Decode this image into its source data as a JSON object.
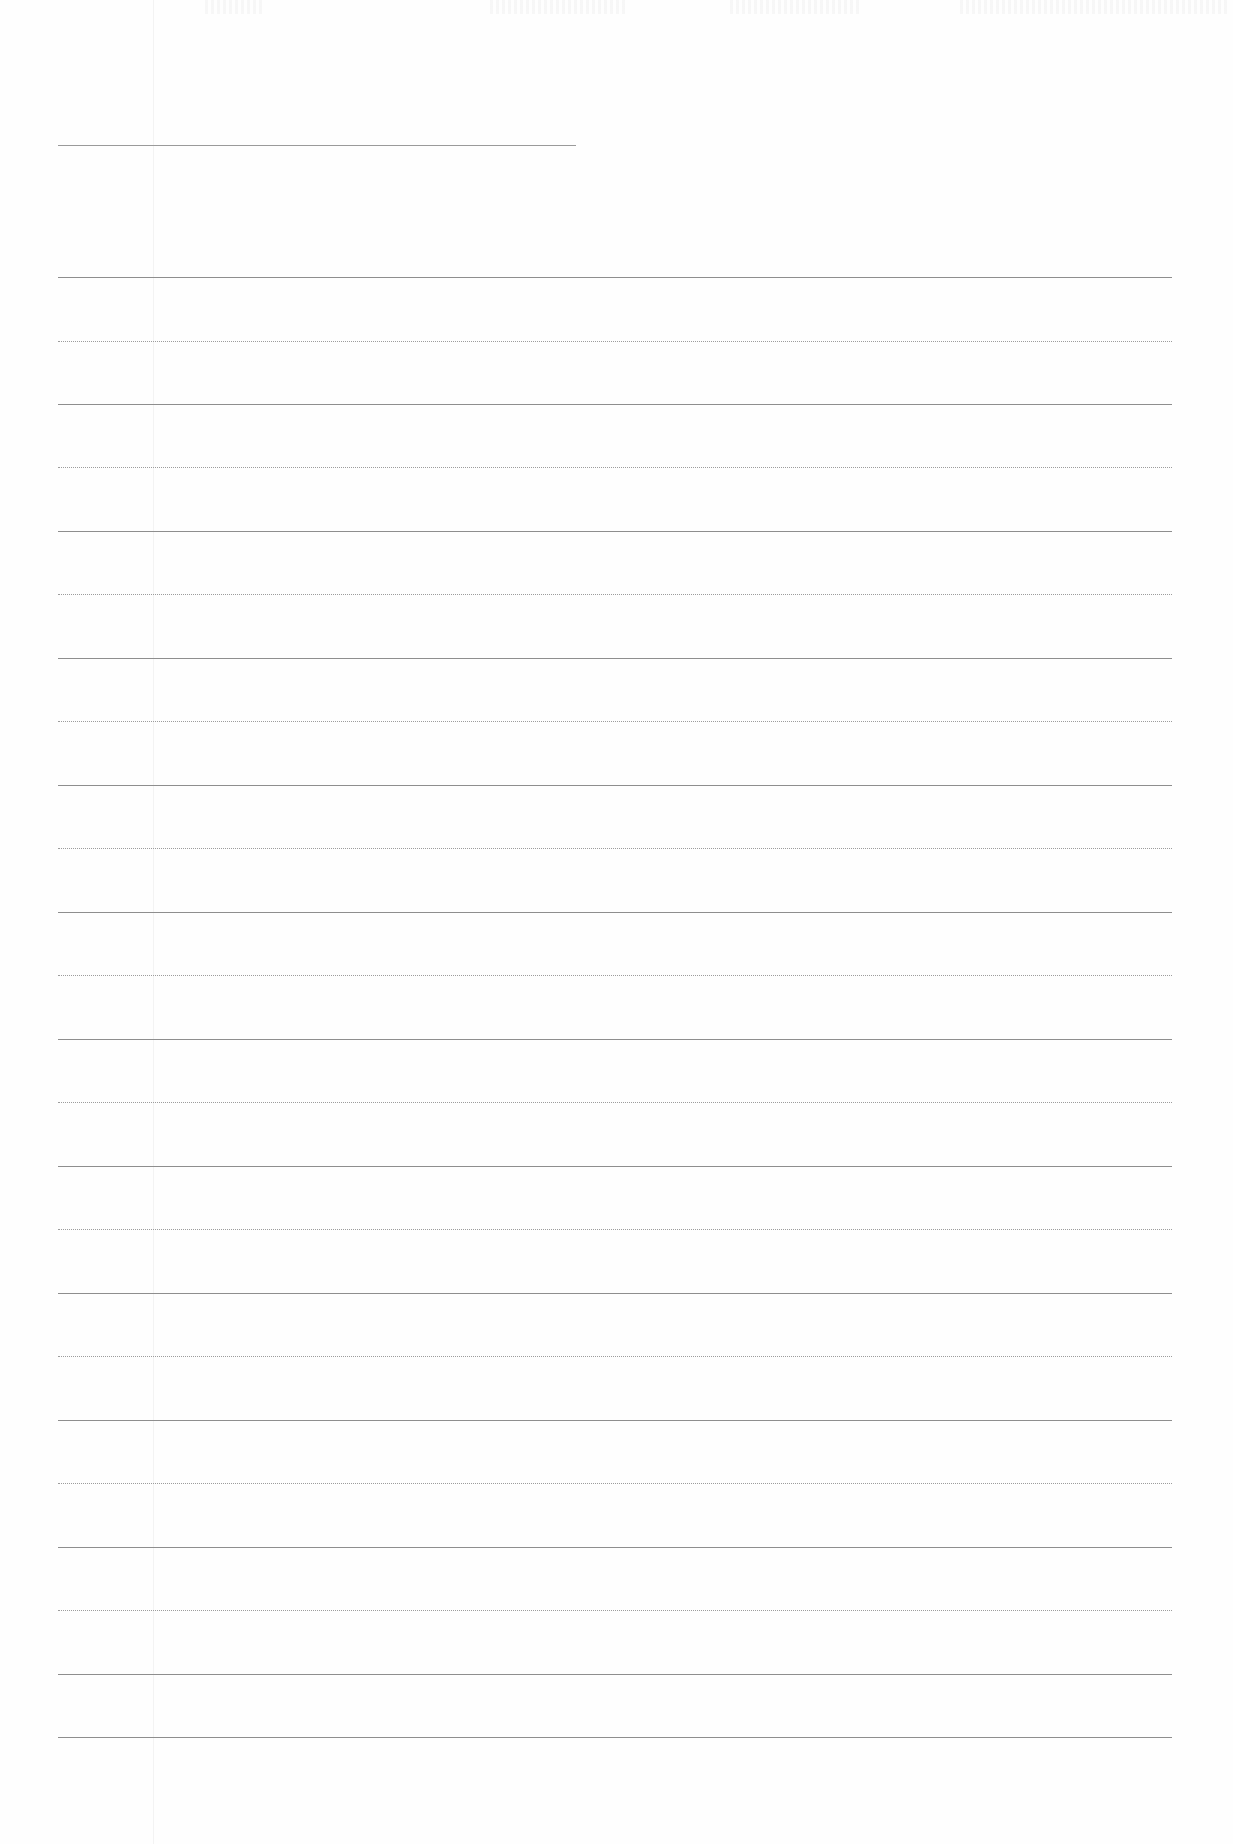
{
  "page": {
    "type": "ruled-notebook-page",
    "background_color": "#fefefe",
    "line_color": "#8e8e8e",
    "header_line": {
      "x_start": 58,
      "x_end": 576,
      "y": 145
    },
    "margin_line_x": 153,
    "rules": {
      "x_start": 58,
      "x_end": 1172,
      "pattern": "alternating solid / dotted",
      "spacing_px": 63.5,
      "lines": [
        {
          "y": 277,
          "style": "solid"
        },
        {
          "y": 341,
          "style": "dotted"
        },
        {
          "y": 404,
          "style": "solid"
        },
        {
          "y": 467,
          "style": "dotted"
        },
        {
          "y": 531,
          "style": "solid"
        },
        {
          "y": 594,
          "style": "dotted"
        },
        {
          "y": 658,
          "style": "solid"
        },
        {
          "y": 721,
          "style": "dotted"
        },
        {
          "y": 785,
          "style": "solid"
        },
        {
          "y": 848,
          "style": "dotted"
        },
        {
          "y": 912,
          "style": "solid"
        },
        {
          "y": 975,
          "style": "dotted"
        },
        {
          "y": 1039,
          "style": "solid"
        },
        {
          "y": 1102,
          "style": "dotted"
        },
        {
          "y": 1166,
          "style": "solid"
        },
        {
          "y": 1229,
          "style": "dotted"
        },
        {
          "y": 1293,
          "style": "solid"
        },
        {
          "y": 1356,
          "style": "dotted"
        },
        {
          "y": 1420,
          "style": "solid"
        },
        {
          "y": 1483,
          "style": "dotted"
        },
        {
          "y": 1547,
          "style": "solid"
        },
        {
          "y": 1610,
          "style": "dotted"
        },
        {
          "y": 1674,
          "style": "solid"
        },
        {
          "y": 1737,
          "style": "solid"
        }
      ]
    },
    "text_content": ""
  }
}
